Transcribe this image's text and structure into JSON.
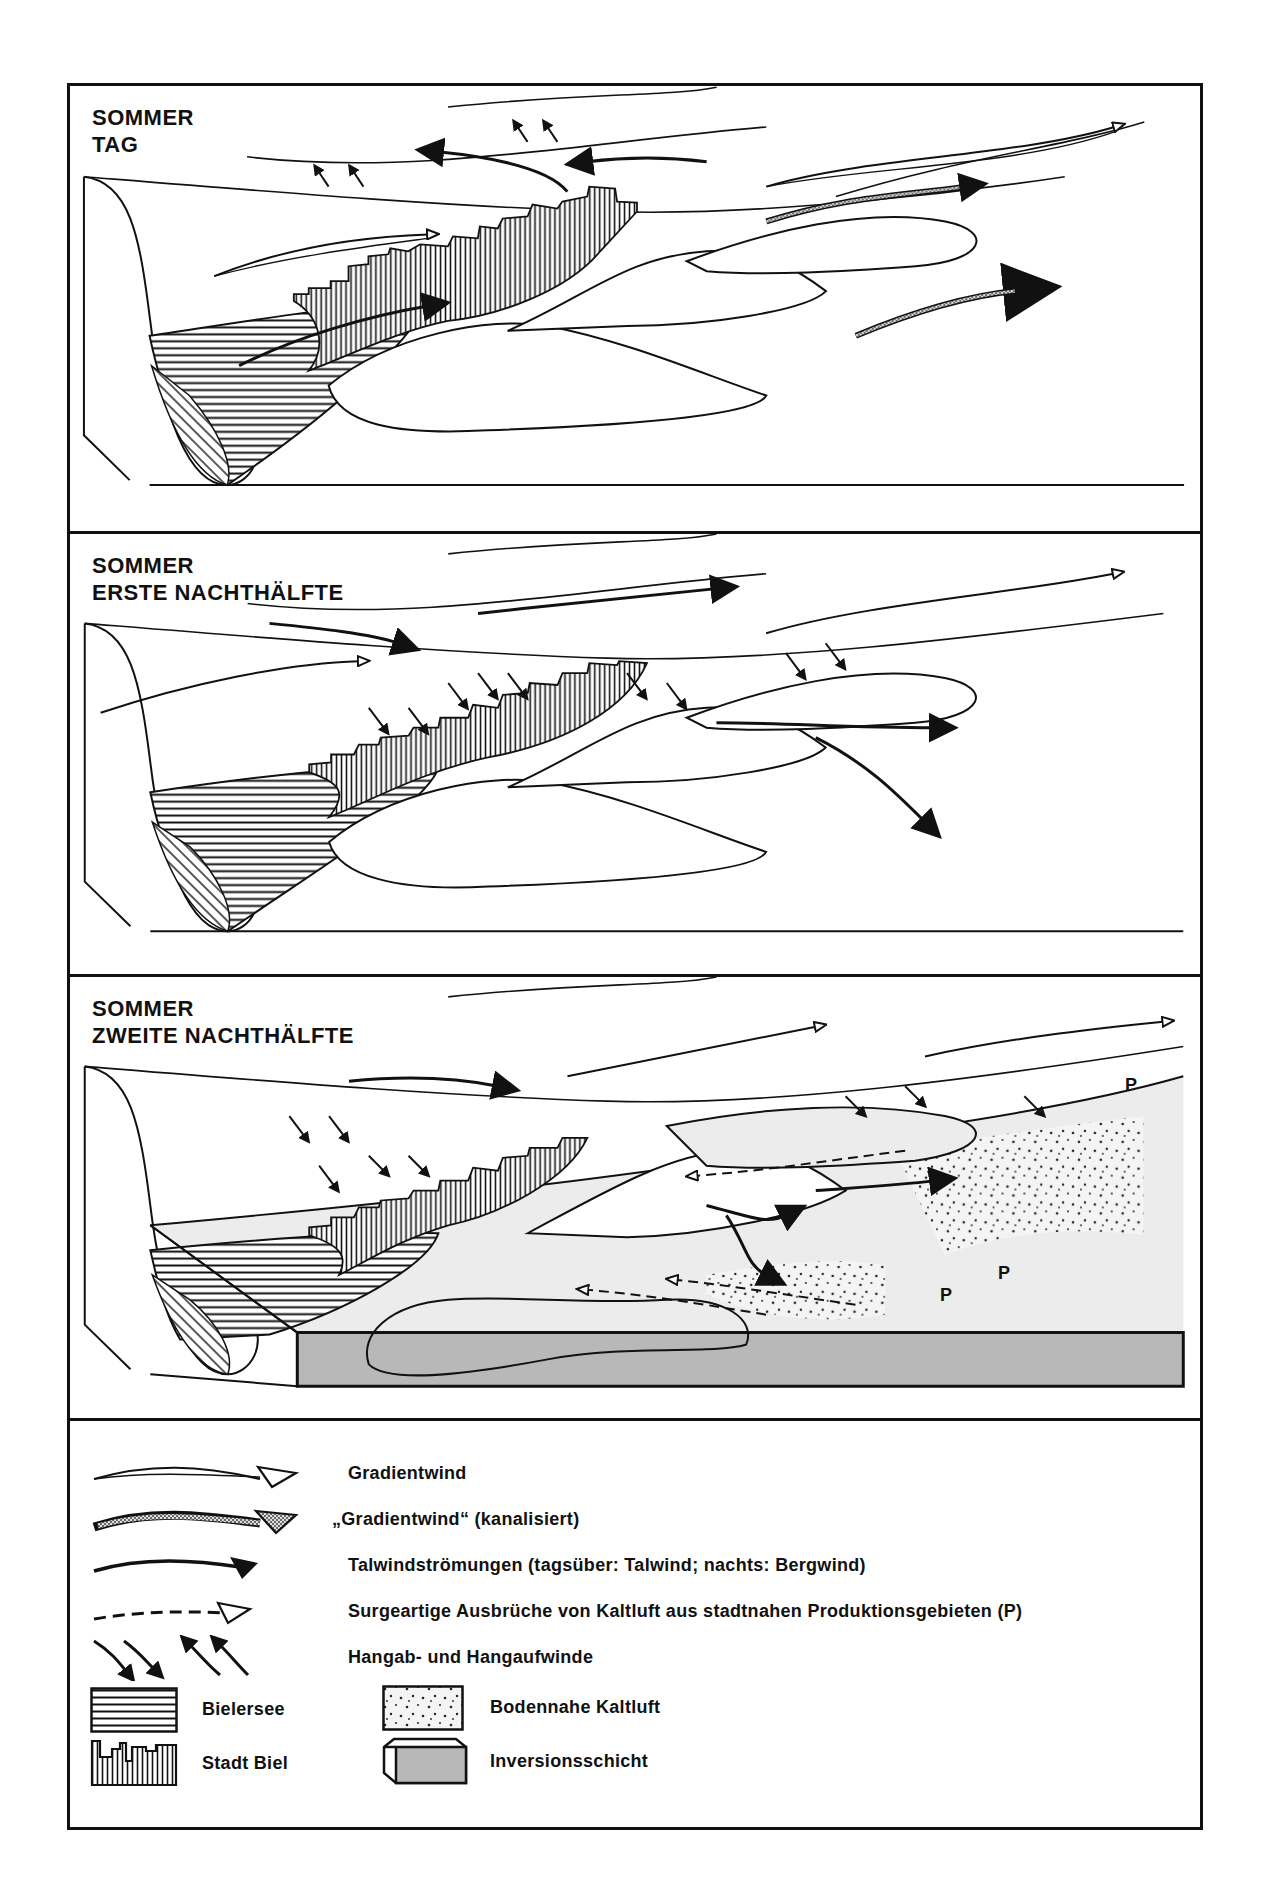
{
  "panels": [
    {
      "title_line1": "SOMMER",
      "title_line2": "TAG"
    },
    {
      "title_line1": "SOMMER",
      "title_line2": "ERSTE NACHTHÄLFTE"
    },
    {
      "title_line1": "SOMMER",
      "title_line2": "ZWEITE NACHTHÄLFTE"
    }
  ],
  "panel3_labels": [
    "P",
    "P",
    "P"
  ],
  "legend": {
    "items": [
      {
        "symbol": "open-arrow",
        "label": "Gradientwind"
      },
      {
        "symbol": "stippled-arrow",
        "label": "„Gradientwind“  (kanalisiert)"
      },
      {
        "symbol": "solid-arrow",
        "label": "Talwindströmungen (tagsüber: Talwind;  nachts: Bergwind)"
      },
      {
        "symbol": "dashed-open-arrow",
        "label": "Surgeartige Ausbrüche von Kaltluft aus stadtnahen Produktionsgebieten  (P)"
      },
      {
        "symbol": "slope-arrows",
        "label": "Hangab- und Hangaufwinde"
      }
    ],
    "areas": [
      {
        "symbol": "horizontal-hatch",
        "label": "Bielersee"
      },
      {
        "symbol": "dotted-fill",
        "label": "Bodennahe Kaltluft"
      },
      {
        "symbol": "vertical-hatch-skyline",
        "label": "Stadt Biel"
      },
      {
        "symbol": "gray-box",
        "label": "Inversionsschicht"
      }
    ]
  },
  "colors": {
    "line": "#111111",
    "inversion_fill": "#b8b8b8",
    "kaltluft_fill": "#ececec",
    "background": "#ffffff"
  }
}
